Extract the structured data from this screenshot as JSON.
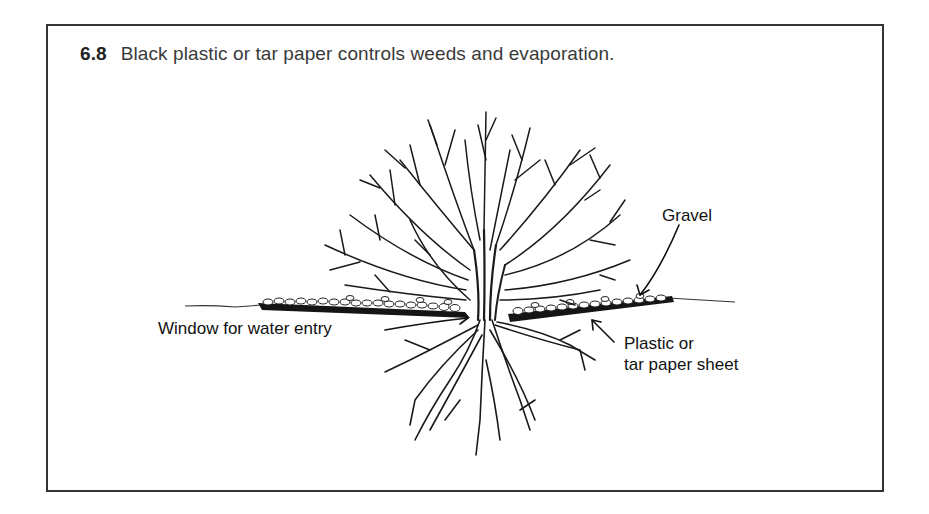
{
  "figure": {
    "number": "6.8",
    "caption": "Black plastic or tar paper controls weeds and evaporation.",
    "border_color": "#333333",
    "ink_color": "#1a1a1a"
  },
  "illustration": {
    "subject": "tree with roots, mulch sheet and gravel",
    "labels": {
      "gravel": "Gravel",
      "window": "Window for water entry",
      "sheet_line1": "Plastic or",
      "sheet_line2": "tar paper sheet"
    }
  }
}
